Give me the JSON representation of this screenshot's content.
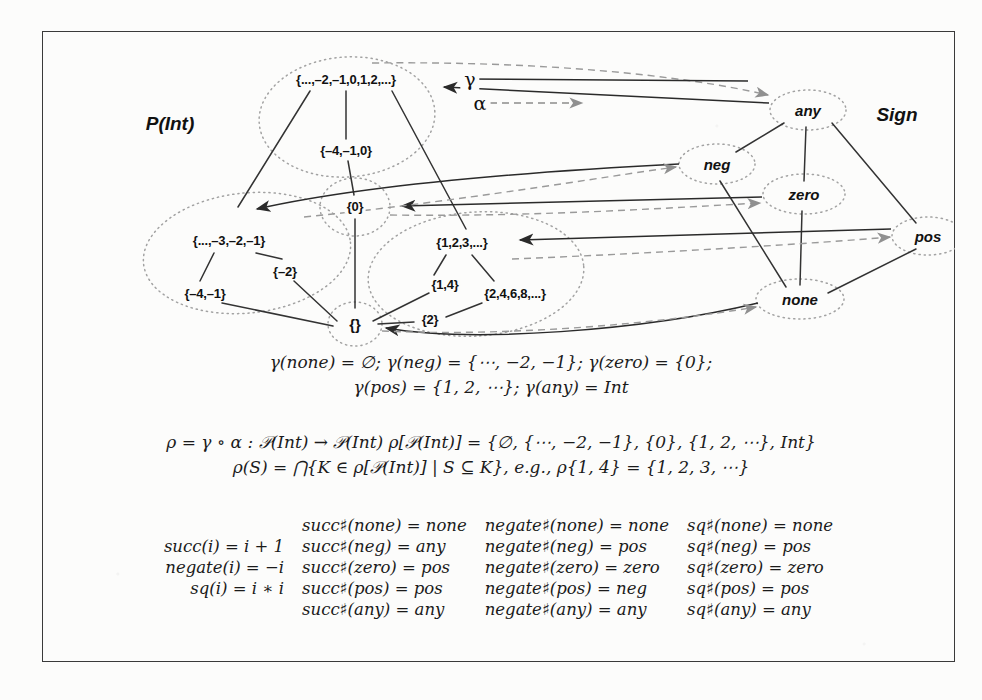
{
  "figure": {
    "concrete_domain_title": "P(Int)",
    "abstract_domain_title": "Sign",
    "legend": {
      "gamma_symbol": "γ",
      "alpha_symbol": "α",
      "gamma_style": "solid-line",
      "alpha_style": "dashed-arrow"
    },
    "concrete_nodes": [
      {
        "id": "int",
        "label": "{...,–2,–1,0,1,2,...}",
        "x": 304,
        "y": 48
      },
      {
        "id": "m4m1z",
        "label": "{–4,–1,0}",
        "x": 304,
        "y": 119
      },
      {
        "id": "negints",
        "label": "{...,–3,–2,–1}",
        "x": 187,
        "y": 209
      },
      {
        "id": "m4m1",
        "label": "{–4,–1}",
        "x": 163,
        "y": 262
      },
      {
        "id": "m2",
        "label": "{–2}",
        "x": 243,
        "y": 240
      },
      {
        "id": "zeroset",
        "label": "{0}",
        "x": 313,
        "y": 175
      },
      {
        "id": "posints",
        "label": "{1,2,3,...}",
        "x": 420,
        "y": 211
      },
      {
        "id": "oneFour",
        "label": "{1,4}",
        "x": 403,
        "y": 253
      },
      {
        "id": "evens",
        "label": "{2,4,6,8,...}",
        "x": 473,
        "y": 262
      },
      {
        "id": "two",
        "label": "{2}",
        "x": 388,
        "y": 288
      },
      {
        "id": "empty",
        "label": "{}",
        "x": 313,
        "y": 293
      }
    ],
    "abstract_nodes": [
      {
        "id": "any",
        "label": "any",
        "x": 766,
        "y": 79
      },
      {
        "id": "neg",
        "label": "neg",
        "x": 675,
        "y": 133
      },
      {
        "id": "zero",
        "label": "zero",
        "x": 762,
        "y": 163
      },
      {
        "id": "pos",
        "label": "pos",
        "x": 886,
        "y": 205
      },
      {
        "id": "none",
        "label": "none",
        "x": 758,
        "y": 268
      }
    ],
    "gamma_equations": [
      "γ(none) = ∅;",
      "γ(neg) = {⋯, −2, −1};",
      "γ(zero) = {0};",
      "γ(pos) = {1, 2, ⋯};",
      "γ(any) = Int"
    ],
    "gamma_lines": [
      "γ(none) = ∅;   γ(neg) = {⋯, −2, −1};   γ(zero) = {0};",
      "γ(pos) = {1, 2, ⋯};   γ(any) = Int"
    ],
    "rho_lines": [
      "ρ = γ ∘ α : 𝒫(Int) → 𝒫(Int)    ρ[𝒫(Int)] = {∅, {⋯, −2, −1}, {0}, {1, 2, ⋯}, Int}",
      "ρ(S) = ⋂{K ∈ ρ[𝒫(Int)] | S ⊆ K},   e.g., ρ{1, 4} = {1, 2, 3, ⋯}"
    ],
    "function_table": {
      "columns": [
        "concrete",
        "succ-sharp",
        "negate-sharp",
        "sq-sharp"
      ],
      "rows": [
        {
          "concrete": "",
          "succ": "succ♯(none) = none",
          "negate": "negate♯(none) = none",
          "sq": "sq♯(none) = none"
        },
        {
          "concrete": "succ(i) = i + 1",
          "succ": "succ♯(neg) = any",
          "negate": "negate♯(neg) = pos",
          "sq": "sq♯(neg) = pos"
        },
        {
          "concrete": "negate(i) = −i",
          "succ": "succ♯(zero) = pos",
          "negate": "negate♯(zero) = zero",
          "sq": "sq♯(zero) = zero"
        },
        {
          "concrete": "sq(i) = i ∗ i",
          "succ": "succ♯(pos) = pos",
          "negate": "negate♯(pos) = neg",
          "sq": "sq♯(pos) = pos"
        },
        {
          "concrete": "",
          "succ": "succ♯(any) = any",
          "negate": "negate♯(any) = any",
          "sq": "sq♯(any) = any"
        }
      ]
    },
    "colors": {
      "ink": "#1a1a1a",
      "frame": "#3a3a3a",
      "dotted_cluster": "#9a9a9a",
      "dashed_alpha": "#8c8c8c",
      "paper": "#fcfcfb"
    }
  }
}
